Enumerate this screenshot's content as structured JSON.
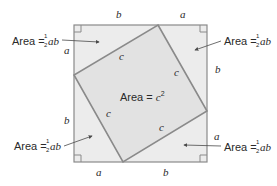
{
  "colors": {
    "outer_fill": "#ececec",
    "inner_fill": "#e2e2e2",
    "stroke": "#8a8a8a",
    "text": "#2a2a2a"
  },
  "outer_square": {
    "side_labels": {
      "top_left": "b",
      "top_right": "a",
      "right_top": "b",
      "right_bottom": "a",
      "bottom_right": "b",
      "bottom_left": "a",
      "left_bottom": "b",
      "left_top": "a"
    }
  },
  "inner_square": {
    "side_labels": [
      "c",
      "c",
      "c",
      "c"
    ],
    "area_prefix": "Area = ",
    "area_var": "c",
    "area_exp": "2"
  },
  "triangles": [
    {
      "position": "top-left",
      "area_prefix": "Area = ",
      "frac_num": "1",
      "frac_den": "2",
      "var": "ab"
    },
    {
      "position": "top-right",
      "area_prefix": "Area = ",
      "frac_num": "1",
      "frac_den": "2",
      "var": "ab"
    },
    {
      "position": "bottom-left",
      "area_prefix": "Area = ",
      "frac_num": "1",
      "frac_den": "2",
      "var": "ab"
    },
    {
      "position": "bottom-right",
      "area_prefix": "Area = ",
      "frac_num": "1",
      "frac_den": "2",
      "var": "ab"
    }
  ]
}
